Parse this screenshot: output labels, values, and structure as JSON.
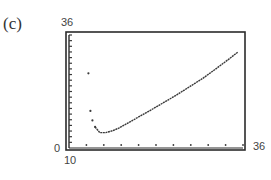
{
  "panel": {
    "label": "(c)"
  },
  "axes": {
    "y_max_label": "36",
    "y_min_label": "0",
    "x_min_label": "10",
    "x_max_label": "36"
  },
  "chart_data": {
    "type": "scatter",
    "title": "(c)",
    "xlabel": "",
    "ylabel": "",
    "xlim": [
      10,
      36
    ],
    "ylim": [
      0,
      36
    ],
    "grid": false,
    "legend": null,
    "x_tick_marks": 10,
    "y_tick_marks": 20,
    "series": [
      {
        "name": "plotted points",
        "points": [
          [
            12.9,
            23.8
          ],
          [
            13.2,
            11.8
          ],
          [
            13.5,
            8.8
          ],
          [
            13.9,
            6.7
          ],
          [
            14.6,
            4.9
          ],
          [
            15.5,
            4.9
          ],
          [
            16.5,
            5.5
          ],
          [
            17.5,
            6.4
          ],
          [
            18.5,
            7.6
          ],
          [
            20,
            9.4
          ],
          [
            22,
            11.8
          ],
          [
            24,
            14.3
          ],
          [
            26,
            16.8
          ],
          [
            28,
            19.5
          ],
          [
            30,
            22.2
          ],
          [
            32,
            25.3
          ],
          [
            34,
            28.5
          ],
          [
            35.2,
            30.5
          ]
        ]
      }
    ]
  },
  "colors": {
    "frame": "#2b2b2b",
    "curve": "#3a3a3a",
    "ticks": "#3a3a3a"
  }
}
